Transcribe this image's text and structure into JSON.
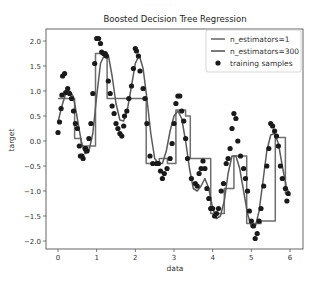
{
  "colors": {
    "background": "#ffffff",
    "frame": "#555555",
    "line_n1": "#6e6e6e",
    "line_n300": "#5a5a5a",
    "points": "#1a1a1a"
  },
  "chart_data": {
    "type": "line",
    "title": "Boosted Decision Tree Regression",
    "xlabel": "data",
    "ylabel": "target",
    "xlim": [
      -0.3,
      6.3
    ],
    "ylim": [
      -2.15,
      2.2
    ],
    "xticks": [
      0,
      1,
      2,
      3,
      4,
      5,
      6
    ],
    "xtick_labels": [
      "0",
      "1",
      "2",
      "3",
      "4",
      "5",
      "6"
    ],
    "yticks": [
      2.0,
      1.5,
      1.0,
      0.5,
      0.0,
      -0.5,
      -1.0,
      -1.5,
      -2.0
    ],
    "ytick_labels": [
      "2.0",
      "1.5",
      "1.0",
      "0.5",
      "0.0",
      "−0.5",
      "−1.0",
      "−1.5",
      "−2.0"
    ],
    "grid": false,
    "legend_position": "upper right",
    "legend": [
      "n_estimators=1",
      "n_estimators=300",
      "training samples"
    ],
    "series": [
      {
        "name": "n_estimators=1",
        "kind": "step",
        "x": [
          0.0,
          0.43,
          0.43,
          0.6,
          0.6,
          0.97,
          0.97,
          1.27,
          1.27,
          2.28,
          2.28,
          2.62,
          2.62,
          2.83,
          2.83,
          3.05,
          3.05,
          3.3,
          3.3,
          3.42,
          3.42,
          3.95,
          3.95,
          4.3,
          4.3,
          4.55,
          4.55,
          4.88,
          4.88,
          5.25,
          5.25,
          5.62,
          5.62,
          5.88,
          5.88,
          6.0
        ],
        "y": [
          0.85,
          0.85,
          0.05,
          0.05,
          -0.1,
          -0.1,
          1.75,
          1.75,
          0.85,
          0.85,
          -0.45,
          -0.45,
          -0.35,
          -0.35,
          -0.45,
          -0.45,
          0.62,
          0.62,
          0.5,
          0.5,
          -0.35,
          -0.35,
          -1.45,
          -1.45,
          -0.95,
          -0.95,
          -0.3,
          -0.3,
          -1.65,
          -1.65,
          -1.6,
          -1.6,
          0.07,
          0.07,
          -1.05,
          -1.05
        ]
      },
      {
        "name": "n_estimators=300",
        "kind": "line",
        "x": [
          0.0,
          0.1,
          0.2,
          0.3,
          0.4,
          0.5,
          0.6,
          0.7,
          0.8,
          0.9,
          1.0,
          1.1,
          1.2,
          1.3,
          1.4,
          1.5,
          1.6,
          1.7,
          1.8,
          1.9,
          2.0,
          2.1,
          2.2,
          2.3,
          2.4,
          2.5,
          2.6,
          2.7,
          2.8,
          2.9,
          3.0,
          3.1,
          3.2,
          3.3,
          3.4,
          3.5,
          3.6,
          3.7,
          3.8,
          3.9,
          4.0,
          4.1,
          4.2,
          4.3,
          4.4,
          4.5,
          4.6,
          4.7,
          4.8,
          4.9,
          5.0,
          5.1,
          5.2,
          5.3,
          5.4,
          5.5,
          5.6,
          5.7,
          5.8,
          5.9,
          6.0
        ],
        "y": [
          0.38,
          0.7,
          0.95,
          1.0,
          0.88,
          0.45,
          0.0,
          -0.25,
          -0.2,
          0.15,
          0.9,
          1.55,
          1.72,
          1.72,
          1.3,
          0.75,
          0.42,
          0.4,
          0.65,
          1.1,
          1.55,
          1.72,
          1.45,
          0.85,
          0.15,
          -0.35,
          -0.45,
          -0.45,
          -0.2,
          0.2,
          0.5,
          0.6,
          0.45,
          0.0,
          -0.55,
          -0.95,
          -1.0,
          -0.9,
          -0.75,
          -0.95,
          -1.35,
          -1.55,
          -1.5,
          -1.2,
          -0.65,
          -0.3,
          -0.3,
          -0.55,
          -1.0,
          -1.45,
          -1.72,
          -1.72,
          -1.4,
          -0.8,
          -0.2,
          0.12,
          0.15,
          -0.05,
          -0.5,
          -0.9,
          -1.1
        ]
      }
    ],
    "scatter": {
      "name": "training samples",
      "x": [
        0.0,
        0.04,
        0.08,
        0.1,
        0.12,
        0.17,
        0.2,
        0.25,
        0.3,
        0.35,
        0.4,
        0.45,
        0.5,
        0.55,
        0.58,
        0.62,
        0.65,
        0.7,
        0.72,
        0.75,
        0.8,
        0.85,
        0.9,
        0.95,
        1.0,
        1.05,
        1.1,
        1.13,
        1.18,
        1.22,
        1.25,
        1.3,
        1.35,
        1.4,
        1.45,
        1.5,
        1.55,
        1.6,
        1.65,
        1.7,
        1.72,
        1.78,
        1.83,
        1.9,
        1.95,
        2.0,
        2.03,
        2.08,
        2.12,
        2.2,
        2.25,
        2.3,
        2.38,
        2.45,
        2.55,
        2.6,
        2.65,
        2.7,
        2.75,
        2.82,
        2.9,
        2.95,
        3.0,
        3.05,
        3.1,
        3.15,
        3.2,
        3.25,
        3.3,
        3.35,
        3.45,
        3.55,
        3.6,
        3.65,
        3.7,
        3.75,
        3.8,
        3.85,
        3.9,
        3.95,
        4.0,
        4.05,
        4.1,
        4.15,
        4.22,
        4.28,
        4.35,
        4.4,
        4.45,
        4.5,
        4.55,
        4.6,
        4.65,
        4.72,
        4.8,
        4.85,
        4.9,
        4.95,
        5.0,
        5.05,
        5.1,
        5.15,
        5.2,
        5.25,
        5.32,
        5.4,
        5.45,
        5.5,
        5.55,
        5.6,
        5.65,
        5.7,
        5.75,
        5.8,
        5.88,
        5.92,
        5.95
      ],
      "y": [
        0.17,
        0.38,
        0.65,
        0.92,
        1.3,
        1.35,
        0.97,
        1.05,
        0.95,
        0.85,
        0.6,
        0.35,
        0.25,
        -0.1,
        -0.3,
        -0.3,
        -0.35,
        -0.15,
        -0.15,
        -0.2,
        0.05,
        0.35,
        0.95,
        1.55,
        2.05,
        2.05,
        1.95,
        1.78,
        1.75,
        1.75,
        1.7,
        1.2,
        0.95,
        0.7,
        0.55,
        0.35,
        0.25,
        0.15,
        0.1,
        0.3,
        0.5,
        0.6,
        0.85,
        1.1,
        1.45,
        1.85,
        1.8,
        1.7,
        1.4,
        1.05,
        0.85,
        0.35,
        -0.3,
        -0.45,
        -0.45,
        -0.45,
        -0.6,
        -0.75,
        -0.65,
        -0.55,
        -0.35,
        -0.05,
        0.35,
        0.75,
        0.9,
        0.9,
        0.6,
        0.4,
        0.05,
        -0.35,
        -0.75,
        -0.85,
        -0.9,
        -0.65,
        -0.55,
        -0.4,
        -0.55,
        -0.95,
        -1.15,
        -1.35,
        -1.35,
        -1.5,
        -1.45,
        -1.35,
        -1.0,
        -0.85,
        -0.45,
        -0.35,
        -0.15,
        0.25,
        0.55,
        0.45,
        0.0,
        -0.3,
        -0.55,
        -0.75,
        -1.0,
        -1.4,
        -1.6,
        -1.7,
        -1.95,
        -1.85,
        -1.6,
        -1.35,
        -0.9,
        -0.5,
        -0.15,
        0.35,
        0.3,
        0.2,
        0.1,
        -0.1,
        -0.5,
        -0.75,
        -0.95,
        -1.2,
        -1.05
      ]
    }
  },
  "header_faint_text": "· · · · · · · ·"
}
